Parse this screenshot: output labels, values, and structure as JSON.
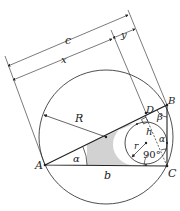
{
  "diagram": {
    "type": "geometry",
    "labels": {
      "c": "c",
      "x": "x",
      "y": "y",
      "R": "R",
      "A": "A",
      "B": "B",
      "C": "C",
      "D": "D",
      "b": "b",
      "a": "a",
      "alpha": "α",
      "beta": "β",
      "h": "h",
      "r": "r",
      "right_angle": "90°"
    },
    "colors": {
      "stroke": "#222222",
      "hatch": "#555555",
      "background": "#ffffff"
    }
  }
}
